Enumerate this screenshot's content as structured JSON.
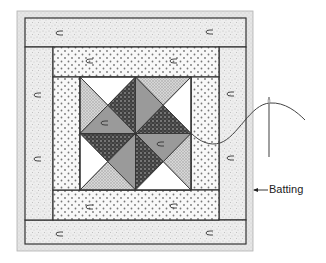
{
  "diagram": {
    "callouts": [
      {
        "id": "batting",
        "text": "Batting"
      }
    ],
    "colors": {
      "background": "#ffffff",
      "batting": "#e2e2e2",
      "speckled_border": "#ececec",
      "dotted_border": "#f6f6f6",
      "dark_fabric": "#4a4a4a",
      "medium_fabric": "#9a9a9a",
      "light_crosshatch": "#cfcfcf",
      "white_fabric": "#ffffff",
      "outline": "#333333",
      "thread": "#444444",
      "needle": "#888888"
    },
    "layers": [
      "batting",
      "outer speckled border (top, right, bottom, left strips)",
      "inner dotted border (top, right, bottom, left strips)",
      "center pinwheel block (2x2 quarter-square triangle units)"
    ],
    "center_block": {
      "units": [
        {
          "position": "top-left",
          "top": "white",
          "left": "light",
          "right": "dark",
          "bottom": "medium"
        },
        {
          "position": "top-right",
          "top": "light",
          "left": "medium",
          "right": "white",
          "bottom": "dark"
        },
        {
          "position": "bottom-left",
          "top": "dark",
          "left": "white",
          "right": "medium",
          "bottom": "light"
        },
        {
          "position": "bottom-right",
          "top": "medium",
          "left": "dark",
          "right": "light",
          "bottom": "white"
        }
      ]
    }
  }
}
